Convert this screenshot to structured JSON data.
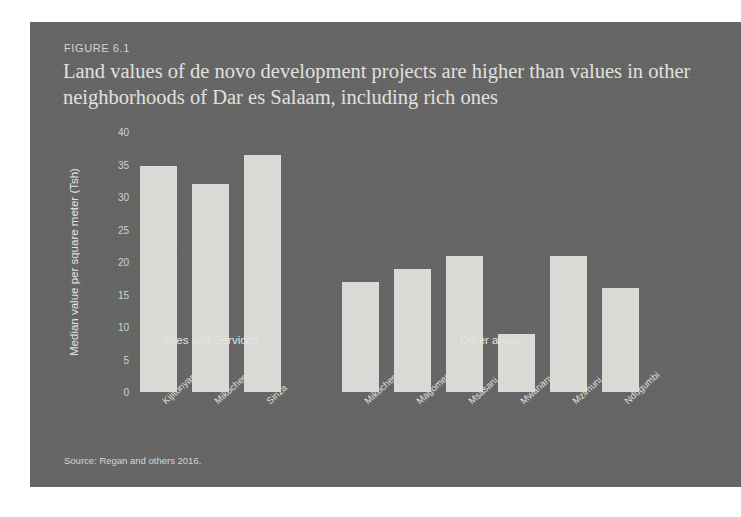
{
  "figure": {
    "label": "FIGURE 6.1",
    "title": "Land values of de novo development projects are higher than values in other neighborhoods of Dar es Salaam, including rich ones",
    "source": "Source: Regan and others 2016."
  },
  "colors": {
    "panel_background": "#656565",
    "bar_fill": "#dcdcd8",
    "text": "#e3e3e0"
  },
  "chart_data": {
    "type": "bar",
    "title": "Land values of de novo development projects are higher than values in other neighborhoods of Dar es Salaam, including rich ones",
    "xlabel": "",
    "ylabel": "Median value per square meter (Tsh)",
    "ylim": [
      0,
      40
    ],
    "yticks": [
      0,
      5,
      10,
      15,
      20,
      25,
      30,
      35,
      40
    ],
    "grid": false,
    "legend": "none",
    "categories": [
      "Kijitonyama",
      "Mikocheni",
      "Sinza",
      "Mikocheni (old)",
      "Magomeni",
      "Msasani",
      "Mwananyamala",
      "Mzimuni",
      "Ndugumbi"
    ],
    "values": [
      34.8,
      32.0,
      36.5,
      17.0,
      19.0,
      21.0,
      9.0,
      21.0,
      16.0
    ],
    "groups": [
      {
        "label": "Sites and Services",
        "categories": [
          "Kijitonyama",
          "Mikocheni",
          "Sinza"
        ]
      },
      {
        "label": "Other areas",
        "categories": [
          "Mikocheni (old)",
          "Magomeni",
          "Msasani",
          "Mwananyamala",
          "Mzimuni",
          "Ndugumbi"
        ]
      }
    ],
    "source": "Source: Regan and others 2016."
  }
}
